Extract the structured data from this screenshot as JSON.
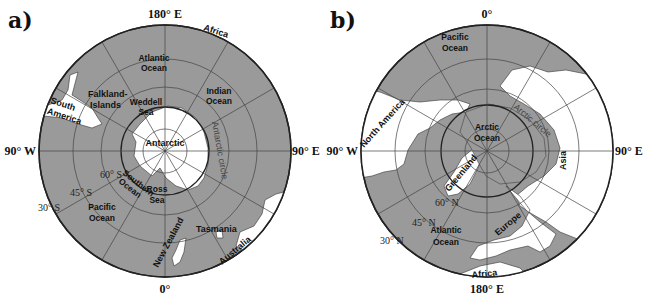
{
  "panels": [
    {
      "id": "a",
      "label": "a)",
      "hemisphere": "south",
      "axis_labels": {
        "top": "180° E",
        "bottom": "0°",
        "left": "90° W",
        "right": "90° E"
      },
      "latitude_labels": [
        "60° S",
        "45° S",
        "30° S"
      ],
      "polar_circle_label": "Antarctic circle",
      "oceans": [
        {
          "name": "Atlantic Ocean",
          "lines": [
            "Atlantic",
            "Ocean"
          ]
        },
        {
          "name": "Indian Ocean",
          "lines": [
            "Indian",
            "Ocean"
          ]
        },
        {
          "name": "Weddell Sea",
          "lines": [
            "Weddell",
            "Sea"
          ]
        },
        {
          "name": "Southern Ocean",
          "lines": [
            "Southern",
            "Ocean"
          ]
        },
        {
          "name": "Ross Sea",
          "lines": [
            "Ross",
            "Sea"
          ]
        },
        {
          "name": "Pacific Ocean",
          "lines": [
            "Pacific",
            "Ocean"
          ]
        }
      ],
      "lands": [
        {
          "name": "Africa"
        },
        {
          "name": "South America",
          "lines": [
            "South",
            "America"
          ]
        },
        {
          "name": "Falkland-Islands",
          "lines": [
            "Falkland-",
            "Islands"
          ]
        },
        {
          "name": "Antarctic"
        },
        {
          "name": "New Zealand"
        },
        {
          "name": "Tasmania"
        },
        {
          "name": "Australia"
        }
      ]
    },
    {
      "id": "b",
      "label": "b)",
      "hemisphere": "north",
      "axis_labels": {
        "top": "0°",
        "bottom": "180° E",
        "left": "90° W",
        "right": "90° E"
      },
      "latitude_labels": [
        "60° N",
        "45° N",
        "30° N"
      ],
      "polar_circle_label": "Arctic circle",
      "oceans": [
        {
          "name": "Pacific Ocean",
          "lines": [
            "Pacific",
            "Ocean"
          ]
        },
        {
          "name": "Arctic Ocean",
          "lines": [
            "Arctic",
            "Ocean"
          ]
        },
        {
          "name": "Atlantic Ocean",
          "lines": [
            "Atlantic",
            "Ocean"
          ]
        }
      ],
      "lands": [
        {
          "name": "North America"
        },
        {
          "name": "Greenland"
        },
        {
          "name": "Asia"
        },
        {
          "name": "Europe"
        },
        {
          "name": "Africa"
        }
      ]
    }
  ]
}
